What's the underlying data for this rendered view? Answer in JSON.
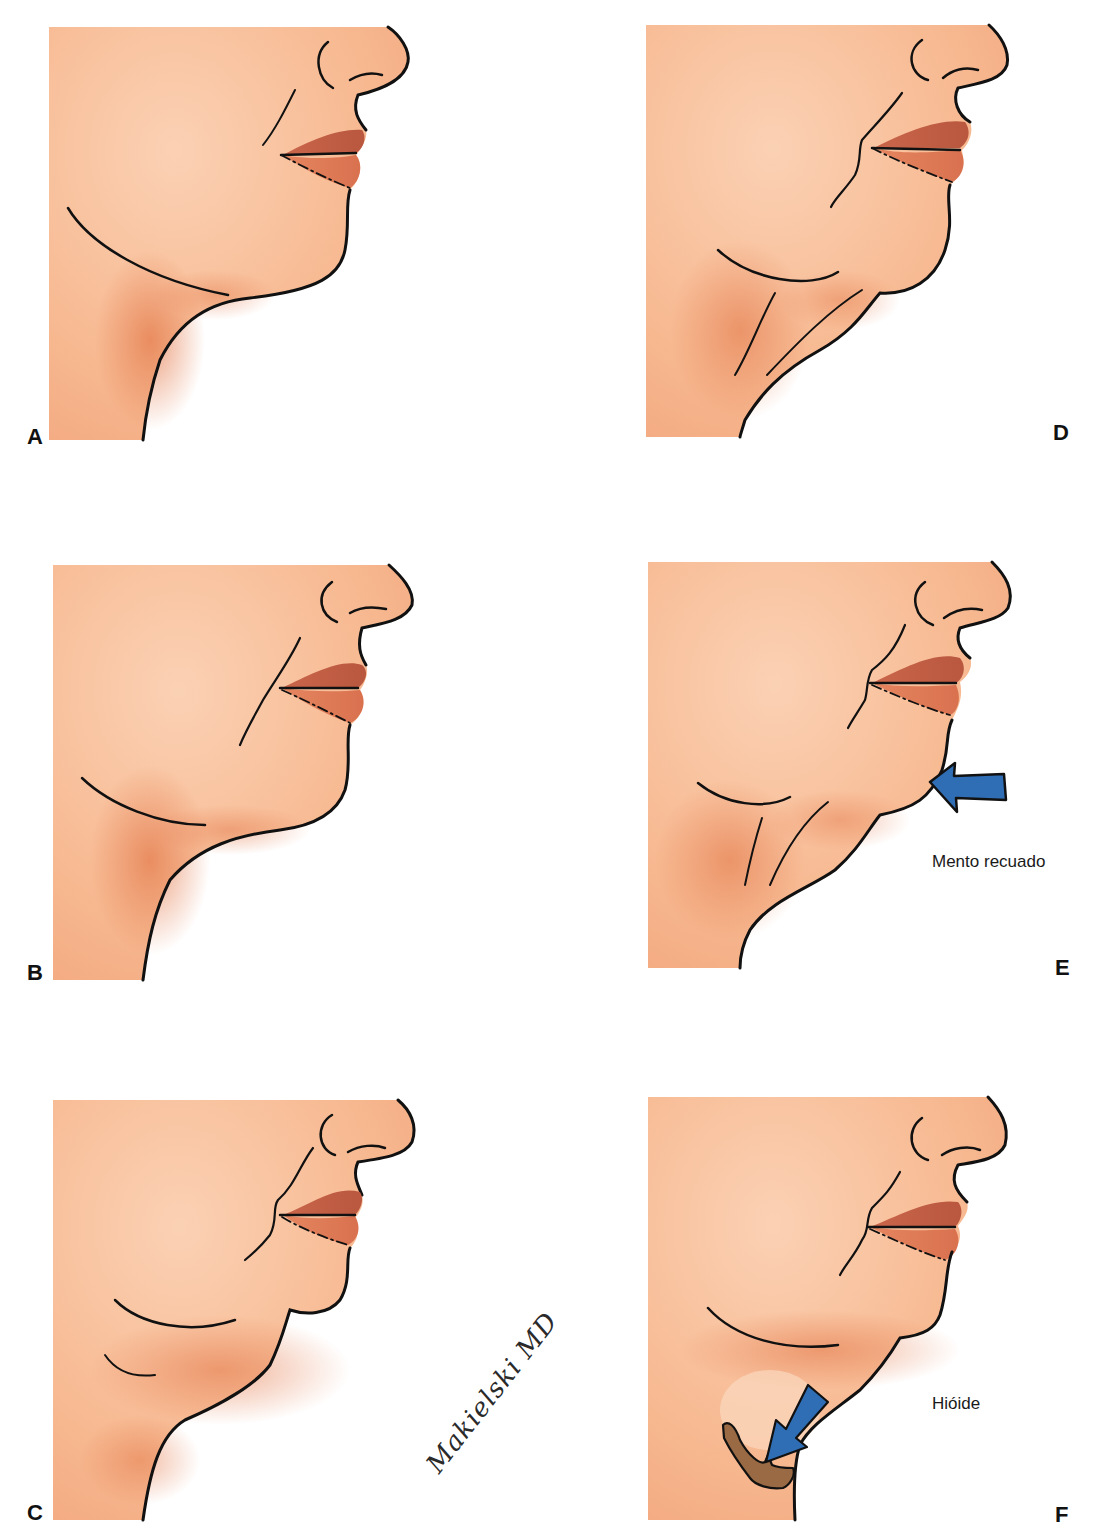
{
  "figure": {
    "panels": [
      {
        "id": "A",
        "label": "A",
        "description": "Perfil cervicofacial normal"
      },
      {
        "id": "B",
        "label": "B"
      },
      {
        "id": "C",
        "label": "C"
      },
      {
        "id": "D",
        "label": "D"
      },
      {
        "id": "E",
        "label": "E",
        "annotation": "Mento recuado"
      },
      {
        "id": "F",
        "label": "F",
        "annotation": "Hióide"
      }
    ],
    "signature": "Makielski MD",
    "colors": {
      "skin": "#f6b892",
      "skin_shadow": "#e9875a",
      "lip": "#d9714f",
      "outline": "#111111",
      "arrow": "#2f6db5",
      "hyoid": "#9a6a45"
    }
  }
}
